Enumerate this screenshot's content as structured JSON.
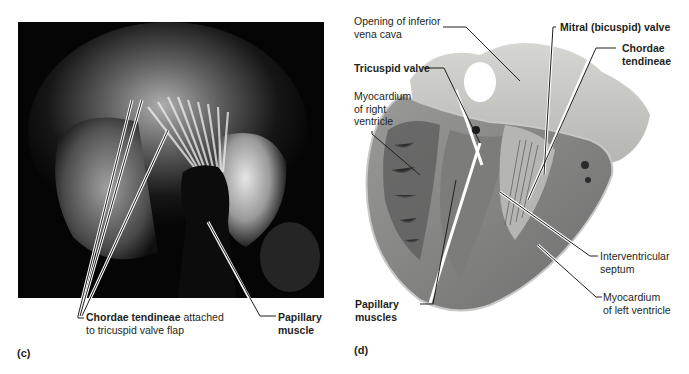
{
  "figure": {
    "panels": [
      {
        "id": "c",
        "letter": "(c)",
        "description": "Interior photo of right ventricle showing chordae tendineae and papillary muscle",
        "labels": {
          "chordae_bold": "Chordae tendineae",
          "chordae_rest": " attached",
          "chordae_line2": "to tricuspid valve flap",
          "papillary_line1": "Papillary",
          "papillary_line2": "muscle"
        }
      },
      {
        "id": "d",
        "letter": "(d)",
        "description": "Frontal section photo of heart showing valves, chordae, septum and ventricles",
        "labels": {
          "ivc_line1": "Opening of inferior",
          "ivc_line2": "vena cava",
          "tricuspid": "Tricuspid valve",
          "myo_right_line1": "Myocardium",
          "myo_right_line2": "of right",
          "myo_right_line3": "ventricle",
          "papillary_line1": "Papillary",
          "papillary_line2": "muscles",
          "mitral": "Mitral (bicuspid) valve",
          "chordae_line1": "Chordae",
          "chordae_line2": "tendineae",
          "septum_line1": "Interventricular",
          "septum_line2": "septum",
          "myo_left_line1": "Myocardium",
          "myo_left_line2": "of left ventricle"
        }
      }
    ]
  },
  "colors": {
    "photo_c_bg": "#050505",
    "heart_tissue": "#8a8a8a",
    "heart_light": "#c9c9c6",
    "text": "#231f20",
    "leader_line": "#231f20"
  }
}
